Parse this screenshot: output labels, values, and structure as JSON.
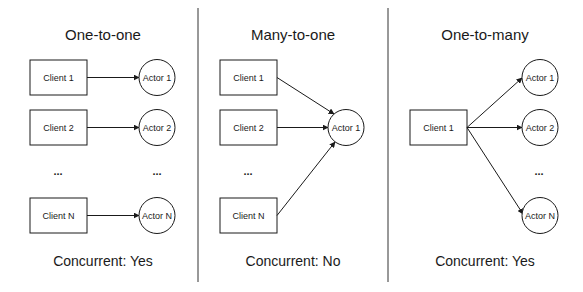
{
  "panels": [
    {
      "title": "One-to-one",
      "clients": [
        "Client 1",
        "Client 2",
        "Client N"
      ],
      "actors": [
        "Actor 1",
        "Actor 2",
        "Actor N"
      ],
      "ellipsis": "...",
      "footer": "Concurrent: Yes"
    },
    {
      "title": "Many-to-one",
      "clients": [
        "Client 1",
        "Client 2",
        "Client N"
      ],
      "actors": [
        "Actor 1"
      ],
      "ellipsis": "...",
      "footer": "Concurrent: No"
    },
    {
      "title": "One-to-many",
      "clients": [
        "Client 1"
      ],
      "actors": [
        "Actor 1",
        "Actor 2",
        "Actor N"
      ],
      "ellipsis": "...",
      "footer": "Concurrent: Yes"
    }
  ],
  "colors": {
    "stroke": "#1a1a1a",
    "background": "#ffffff",
    "divider": "#333333"
  }
}
